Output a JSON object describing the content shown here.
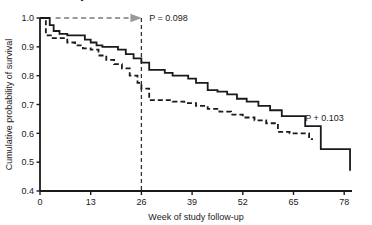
{
  "chart_data": {
    "type": "line",
    "title": "",
    "xlabel": "Week of study follow-up",
    "ylabel": "Cumulative probability of survival",
    "xlim": [
      0,
      80
    ],
    "ylim": [
      0.4,
      1.0
    ],
    "xticks": [
      0,
      13,
      26,
      39,
      52,
      65,
      78
    ],
    "xtick_labels": [
      "0",
      "13",
      "26",
      "39",
      "52",
      "65",
      "78"
    ],
    "yticks": [
      0.4,
      0.5,
      0.6,
      0.7,
      0.8,
      0.9,
      1.0
    ],
    "ytick_labels": [
      "0.4",
      "0.5",
      "0.6",
      "0.7",
      "0.8",
      "0.9",
      "1.0"
    ],
    "grid": false,
    "legend": "none",
    "series": [
      {
        "name": "solid-group",
        "style": "solid",
        "color": "#1a1a1a",
        "step": "post",
        "x": [
          0,
          1.5,
          2.5,
          3.5,
          5,
          7,
          10,
          11.5,
          13,
          14.5,
          16,
          18,
          20,
          22,
          24,
          26,
          28,
          30,
          32,
          34,
          36,
          38,
          40,
          43,
          45.5,
          48,
          50.5,
          53,
          56,
          59,
          62,
          65,
          68,
          72,
          76,
          79,
          79.5
        ],
        "y": [
          1.0,
          1.0,
          0.975,
          0.955,
          0.945,
          0.94,
          0.94,
          0.925,
          0.915,
          0.905,
          0.9,
          0.9,
          0.89,
          0.875,
          0.86,
          0.845,
          0.82,
          0.82,
          0.81,
          0.8,
          0.8,
          0.79,
          0.775,
          0.75,
          0.745,
          0.735,
          0.72,
          0.71,
          0.695,
          0.68,
          0.66,
          0.66,
          0.625,
          0.545,
          0.545,
          0.545,
          0.47
        ]
      },
      {
        "name": "dashed-group",
        "style": "dashed",
        "color": "#1a1a1a",
        "step": "post",
        "x": [
          0,
          1.5,
          3,
          5,
          7,
          9,
          11,
          13,
          15,
          17,
          19,
          21,
          23,
          25,
          26,
          28,
          31,
          34,
          37,
          40,
          43,
          46,
          49,
          52,
          55,
          58,
          61,
          64,
          67,
          69,
          70
        ],
        "y": [
          1.0,
          0.94,
          0.93,
          0.93,
          0.915,
          0.905,
          0.895,
          0.89,
          0.87,
          0.855,
          0.84,
          0.825,
          0.8,
          0.775,
          0.755,
          0.715,
          0.715,
          0.71,
          0.705,
          0.695,
          0.685,
          0.675,
          0.665,
          0.655,
          0.645,
          0.635,
          0.605,
          0.6,
          0.6,
          0.58,
          0.58
        ]
      }
    ],
    "annotations": [
      {
        "name": "study-intervention-label",
        "text": "Study intervention",
        "bold": true,
        "x": 5,
        "y": 1.06
      },
      {
        "name": "p-value-left",
        "text": "P = 0.098",
        "bold": false,
        "x": 28,
        "y": 1.0
      },
      {
        "name": "p-value-right",
        "text": "P + 0.103",
        "bold": false,
        "x": 68,
        "y": 0.655
      }
    ],
    "reference_lines": [
      {
        "name": "intervention-week-marker",
        "orientation": "vertical",
        "value": 26,
        "style": "dashed",
        "color": "#333333"
      }
    ],
    "arrow": {
      "name": "intervention-period-arrow",
      "from_x": 4,
      "to_x": 26,
      "y": 1.0,
      "style": "dashed",
      "color": "#999999"
    }
  },
  "figure": {
    "background": "#ffffff",
    "axis_color": "#1a1a1a"
  }
}
